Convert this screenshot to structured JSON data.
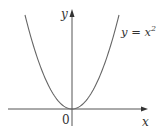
{
  "chart_data": {
    "type": "line",
    "title": "",
    "xlabel": "x",
    "ylabel": "y",
    "origin_label": "0",
    "series": [
      {
        "name": "y = x^2",
        "label_text": "y = x",
        "label_exponent": "2",
        "function": "x^2",
        "x": [
          -2.0,
          -1.5,
          -1.0,
          -0.5,
          0.0,
          0.5,
          1.0,
          1.5,
          2.0
        ],
        "values": [
          4.0,
          2.25,
          1.0,
          0.25,
          0.0,
          0.25,
          1.0,
          2.25,
          4.0
        ]
      }
    ],
    "xlim": [
      -2.8,
      3.2
    ],
    "ylim": [
      -0.7,
      4.3
    ],
    "grid": false,
    "legend": "none",
    "ticks": false,
    "colors": {
      "curve": "#555555",
      "axes": "#444444",
      "text": "#333333"
    }
  },
  "labels": {
    "y_axis": "y",
    "x_axis": "x",
    "origin": "0",
    "curve_base": "y = x",
    "curve_exp": "2"
  }
}
